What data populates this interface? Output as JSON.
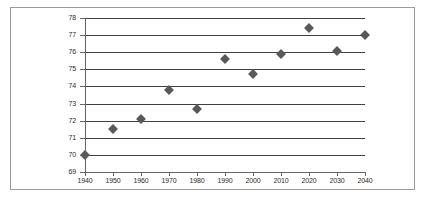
{
  "chart_data": {
    "type": "scatter",
    "title": "",
    "subtitle": "",
    "xlabel": "",
    "ylabel": "",
    "x": [
      1940,
      1950,
      1960,
      1970,
      1980,
      1990,
      2000,
      2010,
      2020,
      2030,
      2040
    ],
    "values": [
      70.0,
      71.5,
      72.1,
      73.8,
      72.7,
      75.6,
      74.7,
      75.9,
      77.4,
      76.1,
      77.0
    ],
    "series": [
      {
        "name": "",
        "values": [
          70.0,
          71.5,
          72.1,
          73.8,
          72.7,
          75.6,
          74.7,
          75.9,
          77.4,
          76.1,
          77.0
        ]
      }
    ],
    "xlim": [
      1940,
      2040
    ],
    "ylim": [
      69,
      78
    ],
    "xticks": [
      1940,
      1950,
      1960,
      1970,
      1980,
      1990,
      2000,
      2010,
      2020,
      2030,
      2040
    ],
    "yticks": [
      69,
      70,
      71,
      72,
      73,
      74,
      75,
      76,
      77,
      78
    ],
    "xtick_labels": [
      "1940",
      "1950",
      "1960",
      "1970",
      "1980",
      "1990",
      "2000",
      "2010",
      "2020",
      "2030",
      "2040"
    ],
    "ytick_labels": [
      "69",
      "70",
      "71",
      "72",
      "73",
      "74",
      "75",
      "76",
      "77",
      "78"
    ],
    "grid": true,
    "grid_axis": "y",
    "legend": false,
    "legend_position": "none",
    "marker": "diamond",
    "marker_color": "#595959",
    "gridline_color": "#404040",
    "axis_color": "#666666",
    "frame_color": "#9a9a9a",
    "background_color": "#ffffff",
    "annotations": []
  }
}
